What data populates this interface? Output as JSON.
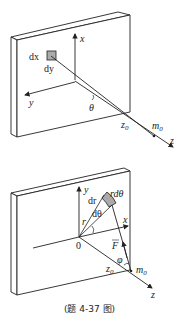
{
  "figure_top": {
    "labels": {
      "dx": "dx",
      "dy": "dy",
      "x": "x",
      "y": "y",
      "theta": "θ",
      "z0": "z",
      "z0_sub": "0",
      "m0": "m",
      "m0_sub": "0",
      "z": "z"
    }
  },
  "figure_bottom": {
    "labels": {
      "y": "y",
      "dr": "dr",
      "rdtheta": "rdθ",
      "r": "r",
      "dtheta": "dθ",
      "x": "x",
      "origin": "0",
      "F": "F",
      "phi": "φ",
      "z0": "z",
      "z0_sub": "0",
      "m0": "m",
      "m0_sub": "0",
      "z": "z"
    }
  },
  "caption": "(题 4-37 图)"
}
